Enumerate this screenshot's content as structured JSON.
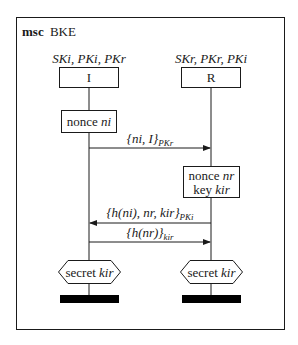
{
  "diagram": {
    "keyword": "msc",
    "title": "BKE",
    "instances": [
      {
        "name": "I",
        "knowledge": "SKi, PKi, PKr"
      },
      {
        "name": "R",
        "knowledge": "SKr, PKr, PKi"
      }
    ],
    "actions": [
      {
        "instance": "I",
        "lines": [
          {
            "plain": "nonce ",
            "italic": "ni"
          }
        ]
      },
      {
        "instance": "R",
        "lines": [
          {
            "plain": "nonce ",
            "italic": "nr"
          },
          {
            "plain": "key ",
            "italic": "kir"
          }
        ]
      }
    ],
    "messages": [
      {
        "from": "I",
        "to": "R",
        "body": "{ni, I}",
        "subscript": "PKr"
      },
      {
        "from": "R",
        "to": "I",
        "body": "{h(ni), nr, kir}",
        "subscript": "PKi"
      },
      {
        "from": "I",
        "to": "R",
        "body": "{h(nr)}",
        "subscript": "kir"
      }
    ],
    "claims": [
      {
        "instance": "I",
        "plain": "secret ",
        "italic": "kir"
      },
      {
        "instance": "R",
        "plain": "secret ",
        "italic": "kir"
      }
    ],
    "colors": {
      "line": "#1a1a1a",
      "background": "#ffffff",
      "terminator": "#000000"
    }
  }
}
